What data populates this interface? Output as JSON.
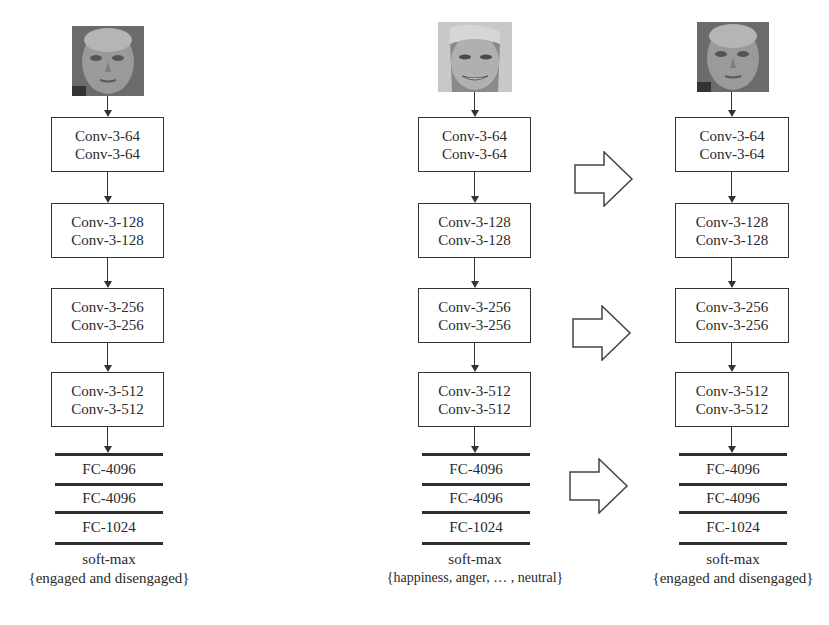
{
  "columns": [
    {
      "id": "left",
      "face": {
        "name": "face-image-engaged-student",
        "tone": "dark"
      },
      "conv_blocks": [
        {
          "lines": [
            "Conv-3-64",
            "Conv-3-64"
          ]
        },
        {
          "lines": [
            "Conv-3-128",
            "Conv-3-128"
          ]
        },
        {
          "lines": [
            "Conv-3-256",
            "Conv-3-256"
          ]
        },
        {
          "lines": [
            "Conv-3-512",
            "Conv-3-512"
          ]
        }
      ],
      "fc_layers": [
        "FC-4096",
        "FC-4096",
        "FC-1024"
      ],
      "softmax": "soft-max",
      "output": "{engaged and disengaged}"
    },
    {
      "id": "middle",
      "face": {
        "name": "face-image-smiling-woman",
        "tone": "light"
      },
      "conv_blocks": [
        {
          "lines": [
            "Conv-3-64",
            "Conv-3-64"
          ]
        },
        {
          "lines": [
            "Conv-3-128",
            "Conv-3-128"
          ]
        },
        {
          "lines": [
            "Conv-3-256",
            "Conv-3-256"
          ]
        },
        {
          "lines": [
            "Conv-3-512",
            "Conv-3-512"
          ]
        }
      ],
      "fc_layers": [
        "FC-4096",
        "FC-4096",
        "FC-1024"
      ],
      "softmax": "soft-max",
      "output": "{happiness, anger, … , neutral}"
    },
    {
      "id": "right",
      "face": {
        "name": "face-image-engaged-student",
        "tone": "dark"
      },
      "conv_blocks": [
        {
          "lines": [
            "Conv-3-64",
            "Conv-3-64"
          ]
        },
        {
          "lines": [
            "Conv-3-128",
            "Conv-3-128"
          ]
        },
        {
          "lines": [
            "Conv-3-256",
            "Conv-3-256"
          ]
        },
        {
          "lines": [
            "Conv-3-512",
            "Conv-3-512"
          ]
        }
      ],
      "fc_layers": [
        "FC-4096",
        "FC-4096",
        "FC-1024"
      ],
      "softmax": "soft-max",
      "output": "{engaged and disengaged}"
    }
  ],
  "transfer_arrows": [
    {
      "name": "transfer-arrow-conv64"
    },
    {
      "name": "transfer-arrow-conv256"
    },
    {
      "name": "transfer-arrow-fc"
    }
  ],
  "colors": {
    "line": "#333333",
    "text": "#2a2a2a",
    "background": "#ffffff"
  }
}
